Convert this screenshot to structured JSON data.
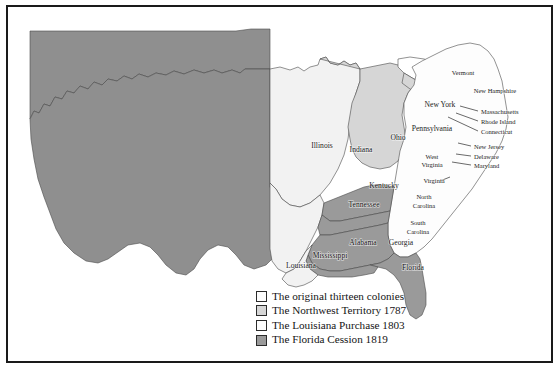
{
  "colors": {
    "original_colonies": "#fdfdfd",
    "northwest_territory": "#d6d6d6",
    "louisiana_purchase": "#f2f2f2",
    "florida_cession": "#9a9a9a",
    "unorganized_west": "#8f8f8f",
    "great_lakes": "#ffffff",
    "border_line": "#4a4a4a",
    "frame": "#1a1a1a",
    "label_text": "#1b1b1b",
    "page_background": "#ffffff"
  },
  "legend": {
    "items": [
      {
        "label": "The original thirteen colonies",
        "swatch": "#fdfdfd"
      },
      {
        "label": "The Northwest Territory 1787",
        "swatch": "#d6d6d6"
      },
      {
        "label": "The Louisiana Purchase 1803",
        "swatch": "#fdfdfd"
      },
      {
        "label": "The Florida Cession 1819",
        "swatch": "#9a9a9a"
      }
    ]
  },
  "map_labels": {
    "vermont": "Vermont",
    "new_hampshire": "New Hampshire",
    "new_york": "New York",
    "massachusetts": "Massachusetts",
    "rhode_island": "Rhode Island",
    "connecticut": "Connecticut",
    "pennsylvania": "Pennsylvania",
    "new_jersey": "New Jersey",
    "delaware": "Delaware",
    "maryland": "Maryland",
    "ohio": "Ohio",
    "indiana": "Indiana",
    "illinois": "Illinois",
    "west_virginia_line1": "West",
    "west_virginia_line2": "Virginia",
    "virginia": "Virginia",
    "kentucky": "Kentucky",
    "tennessee": "Tennessee",
    "north_carolina_line1": "North",
    "north_carolina_line2": "Carolina",
    "south_carolina_line1": "South",
    "south_carolina_line2": "Carolina",
    "georgia": "Georgia",
    "alabama": "Alabama",
    "mississippi": "Mississippi",
    "louisiana": "Louisiana",
    "florida": "Florida"
  }
}
